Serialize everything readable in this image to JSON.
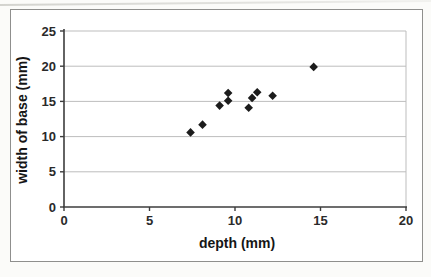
{
  "chart_data": {
    "type": "scatter",
    "title": "",
    "xlabel": "depth (mm)",
    "ylabel": "width of base (mm)",
    "xlim": [
      0,
      20
    ],
    "ylim": [
      0,
      25
    ],
    "xticks": [
      "0",
      "5",
      "10",
      "15",
      "20"
    ],
    "yticks": [
      "0",
      "5",
      "10",
      "15",
      "20",
      "25"
    ],
    "grid": "horizontal",
    "legend": "none",
    "marker": "diamond",
    "series": [
      {
        "name": "width of base vs depth",
        "points": [
          [
            7.4,
            10.6
          ],
          [
            8.1,
            11.7
          ],
          [
            9.1,
            14.4
          ],
          [
            9.6,
            15.1
          ],
          [
            9.6,
            16.2
          ],
          [
            10.8,
            14.1
          ],
          [
            11.0,
            15.5
          ],
          [
            11.3,
            16.3
          ],
          [
            12.2,
            15.8
          ],
          [
            14.6,
            19.9
          ]
        ]
      }
    ]
  },
  "colors": {
    "marker": "#1c1c1c",
    "gridline": "#bdbdbd",
    "plot_border": "#bdbdbd",
    "axis_line": "#3d3d3d",
    "tick_text": "#2a2a2a",
    "frame_border": "#8f8f8d",
    "background": "#ffffff"
  }
}
